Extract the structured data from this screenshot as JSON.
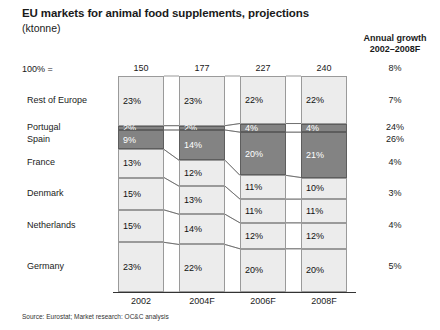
{
  "title": "EU markets for animal food supplements, projections",
  "subtitle": "(ktonne)",
  "scale_label": "100% =",
  "growth_header_line1": "Annual growth",
  "growth_header_line2": "2002–2008F",
  "source": "Source: Eurostat; Market research: OC&C analysis",
  "chart_data": {
    "type": "bar",
    "title": "EU markets for animal food supplements, projections",
    "ylabel": "(ktonne)",
    "xlabel": "",
    "categories": [
      "2002",
      "2004F",
      "2006F",
      "2008F"
    ],
    "totals": [
      150,
      177,
      227,
      240
    ],
    "total_unit": "ktonne",
    "stacked": true,
    "normalized_percent": true,
    "ylim": [
      0,
      100
    ],
    "grid": false,
    "legend": "none",
    "series": [
      {
        "name": "Rest of Europe",
        "values": [
          23,
          23,
          22,
          22
        ],
        "growth": "7%",
        "highlight": false
      },
      {
        "name": "Portugal",
        "values": [
          2,
          2,
          4,
          4
        ],
        "growth": "24%",
        "highlight": true
      },
      {
        "name": "Spain",
        "values": [
          9,
          14,
          20,
          21
        ],
        "growth": "26%",
        "highlight": true
      },
      {
        "name": "France",
        "values": [
          13,
          12,
          11,
          10
        ],
        "growth": "4%",
        "highlight": false
      },
      {
        "name": "Denmark",
        "values": [
          15,
          13,
          11,
          11
        ],
        "growth": "3%",
        "highlight": false
      },
      {
        "name": "Netherlands",
        "values": [
          15,
          14,
          12,
          12
        ],
        "growth": "4%",
        "highlight": false
      },
      {
        "name": "Germany",
        "values": [
          23,
          22,
          20,
          20
        ],
        "growth": "5%",
        "highlight": false
      }
    ],
    "total_growth": "8%",
    "value_suffix": "%",
    "colors": {
      "highlight": "#838383",
      "normal": "#ececec",
      "border": "#9a9a9a",
      "text_on_highlight": "#ffffff"
    }
  }
}
